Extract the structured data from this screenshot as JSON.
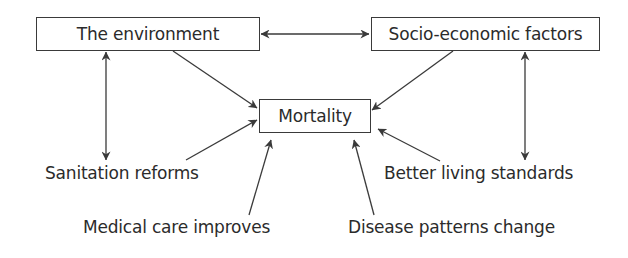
{
  "diagram": {
    "nodes": {
      "environment": {
        "label": "The environment"
      },
      "socio": {
        "label": "Socio-economic factors"
      },
      "mortality": {
        "label": "Mortality"
      }
    },
    "factors": {
      "sanitation": {
        "label": "Sanitation reforms"
      },
      "living": {
        "label": "Better living standards"
      },
      "medical": {
        "label": "Medical care improves"
      },
      "disease": {
        "label": "Disease patterns change"
      }
    },
    "edges": [
      {
        "from": "The environment",
        "to": "Socio-economic factors",
        "direction": "both"
      },
      {
        "from": "The environment",
        "to": "Mortality",
        "direction": "forward"
      },
      {
        "from": "Socio-economic factors",
        "to": "Mortality",
        "direction": "forward"
      },
      {
        "from": "The environment",
        "to": "Sanitation reforms",
        "direction": "both"
      },
      {
        "from": "Socio-economic factors",
        "to": "Better living standards",
        "direction": "both"
      },
      {
        "from": "Sanitation reforms",
        "to": "Mortality",
        "direction": "forward"
      },
      {
        "from": "Medical care improves",
        "to": "Mortality",
        "direction": "forward"
      },
      {
        "from": "Disease patterns change",
        "to": "Mortality",
        "direction": "forward"
      },
      {
        "from": "Better living standards",
        "to": "Mortality",
        "direction": "forward"
      }
    ],
    "colors": {
      "line": "#3a3a3a",
      "text": "#2b2b2b",
      "background": "#ffffff"
    }
  }
}
